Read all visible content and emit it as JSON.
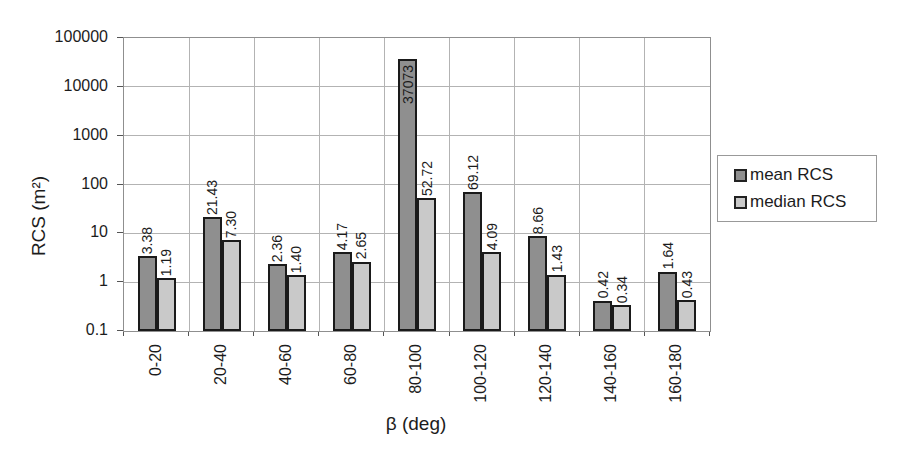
{
  "chart_data": {
    "type": "bar",
    "y_scale": "log",
    "title": "",
    "xlabel": "β (deg)",
    "ylabel": "RCS (m²)",
    "ylim": [
      0.1,
      100000
    ],
    "y_tick_labels": [
      "100000",
      "10000",
      "1000",
      "100",
      "10",
      "1",
      "0.1"
    ],
    "grid": true,
    "legend_position": "right",
    "categories": [
      "0-20",
      "20-40",
      "40-60",
      "60-80",
      "80-100",
      "100-120",
      "120-140",
      "140-160",
      "160-180"
    ],
    "series": [
      {
        "name": "mean RCS",
        "color": "#8f8f8f",
        "values": [
          3.38,
          21.43,
          2.36,
          4.17,
          37073,
          69.12,
          8.66,
          0.42,
          1.64
        ],
        "labels": [
          "3.38",
          "21.43",
          "2.36",
          "4.17",
          "37073",
          "69.12",
          "8.66",
          "0.42",
          "1.64"
        ]
      },
      {
        "name": "median RCS",
        "color": "#c9c9c9",
        "values": [
          1.19,
          7.3,
          1.4,
          2.65,
          52.72,
          4.09,
          1.43,
          0.34,
          0.43
        ],
        "labels": [
          "1.19",
          "7.30",
          "1.40",
          "2.65",
          "52.72",
          "4.09",
          "1.43",
          "0.34",
          "0.43"
        ]
      }
    ],
    "label_inside": {
      "series": 0,
      "index": 4
    }
  }
}
